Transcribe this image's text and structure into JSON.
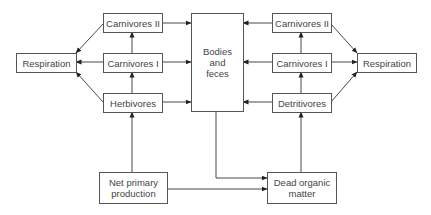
{
  "diagram": {
    "type": "energy-flow",
    "nodes": {
      "respiration_left": "Respiration",
      "carnivores2_left": "Carnivores II",
      "carnivores1_left": "Carnivores I",
      "herbivores": "Herbivores",
      "bodies": "Bodies and feces",
      "bodies_lines": [
        "Bodies",
        "and",
        "feces"
      ],
      "carnivores2_right": "Carnivores II",
      "carnivores1_right": "Carnivores I",
      "detritivores": "Detritivores",
      "respiration_right": "Respiration",
      "net_primary_lines": [
        "Net primary",
        "production"
      ],
      "dead_organic_lines": [
        "Dead organic",
        "matter"
      ]
    },
    "edges": [
      [
        "Net primary production",
        "Herbivores"
      ],
      [
        "Net primary production",
        "Dead organic matter"
      ],
      [
        "Herbivores",
        "Carnivores I"
      ],
      [
        "Carnivores I",
        "Carnivores II"
      ],
      [
        "Herbivores",
        "Respiration"
      ],
      [
        "Carnivores I",
        "Respiration"
      ],
      [
        "Carnivores II",
        "Respiration"
      ],
      [
        "Herbivores",
        "Bodies and feces"
      ],
      [
        "Carnivores I",
        "Bodies and feces"
      ],
      [
        "Carnivores II",
        "Bodies and feces"
      ],
      [
        "Bodies and feces",
        "Dead organic matter"
      ],
      [
        "Dead organic matter",
        "Detritivores"
      ],
      [
        "Detritivores",
        "Carnivores I (right)"
      ],
      [
        "Carnivores I (right)",
        "Carnivores II (right)"
      ],
      [
        "Detritivores",
        "Bodies and feces"
      ],
      [
        "Carnivores I (right)",
        "Bodies and feces"
      ],
      [
        "Carnivores II (right)",
        "Bodies and feces"
      ],
      [
        "Detritivores",
        "Respiration (right)"
      ],
      [
        "Carnivores I (right)",
        "Respiration (right)"
      ],
      [
        "Carnivores II (right)",
        "Respiration (right)"
      ]
    ]
  }
}
